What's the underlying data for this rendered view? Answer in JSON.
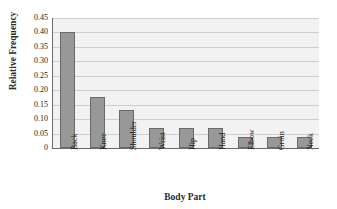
{
  "chart_data": {
    "type": "bar",
    "title": "",
    "xlabel": "Body Part",
    "ylabel": "Relative Frequency",
    "categories": [
      "Back",
      "Knee",
      "Shoulder",
      "Wrist",
      "Hip",
      "Hand",
      "Elbow",
      "Groin",
      "Neck"
    ],
    "values": [
      0.4,
      0.175,
      0.13,
      0.07,
      0.07,
      0.068,
      0.038,
      0.038,
      0.039
    ],
    "ylim": [
      0,
      0.45
    ],
    "ytick_labels": [
      "0.45",
      "0.40",
      "0.35",
      "0.30",
      "0.25",
      "0.20",
      "0.15",
      "0.10",
      "0.05",
      "0"
    ],
    "ytick_values": [
      0.45,
      0.4,
      0.35,
      0.3,
      0.25,
      0.2,
      0.15,
      0.1,
      0.05,
      0
    ],
    "grid": true,
    "legend": false,
    "bar_color": "#989898",
    "bar_border_color": "#6a6a6a",
    "plot_background": "#f2f2f2",
    "gridline_color": "#cfcfcf",
    "axis_color": "#6b6b6b"
  },
  "axes": {
    "y_title": "Relative Frequency",
    "x_title": "Body Part"
  }
}
